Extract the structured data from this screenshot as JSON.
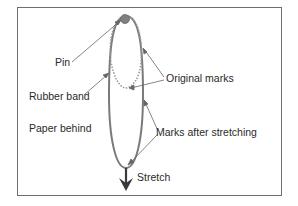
{
  "diagram": {
    "labels": {
      "pin": "Pin",
      "rubber_band": "Rubber band",
      "paper_behind": "Paper behind",
      "original_marks": "Original marks",
      "marks_after_stretching": "Marks after stretching",
      "stretch": "Stretch"
    },
    "colors": {
      "band": "#7a7a7a",
      "original_loop": "#9a9a9a",
      "pin": "#808080",
      "leader": "#666666",
      "arrow": "#3a3a3a",
      "frame": "#6e6e6e"
    }
  }
}
